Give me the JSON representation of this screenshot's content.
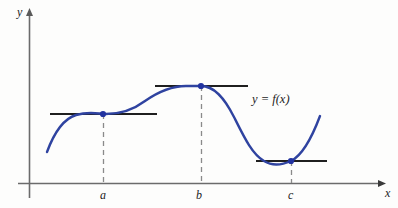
{
  "figure": {
    "title": "",
    "background_color": "#fdfdfc",
    "curve_color": "#2f43a0",
    "axis_color": "#6b6b6b",
    "tangent_color": "#1f1f1f",
    "dash_color": "#8a8a8a",
    "point_color": "#2233a0"
  },
  "axes": {
    "y_label": "y",
    "x_label": "x",
    "x_axis_y": 183,
    "y_axis_x": 29
  },
  "ticks": [
    {
      "label": "a",
      "x": 103
    },
    {
      "label": "b",
      "x": 201
    },
    {
      "label": "c",
      "x": 291
    }
  ],
  "curve": {
    "label": "y = f(x)",
    "path": "M 47,152 C 54,133 63,119 76,115 C 90,111 98,114 106,114 C 120,114 133,110 145,101 C 158,92 172,86 186,86 C 193,86 198,86 201,86 C 214,86 224,97 234,117 C 244,137 252,154 264,161 C 272,166 282,165 291,161 C 301,156 311,140 320,116"
  },
  "critical_points": [
    {
      "name": "a",
      "x": 103,
      "y": 114,
      "type": "horizontal-tangent-inflection"
    },
    {
      "name": "b",
      "x": 201,
      "y": 86,
      "type": "local-maximum"
    },
    {
      "name": "c",
      "x": 291,
      "y": 161,
      "type": "local-minimum"
    }
  ],
  "tangent_lines": [
    {
      "at": "a",
      "y": 114,
      "x1": 50,
      "x2": 157
    },
    {
      "at": "b",
      "y": 86,
      "x1": 155,
      "x2": 248
    },
    {
      "at": "c",
      "y": 161,
      "x1": 256,
      "x2": 327
    }
  ],
  "dashed_drops": [
    {
      "at": "a",
      "x": 103,
      "y_top": 114,
      "y_bottom": 183
    },
    {
      "at": "b",
      "x": 201,
      "y_top": 86,
      "y_bottom": 183
    },
    {
      "at": "c",
      "x": 291,
      "y_top": 161,
      "y_bottom": 183
    }
  ]
}
